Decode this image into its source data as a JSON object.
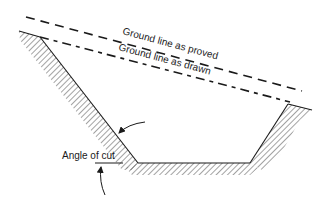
{
  "diagram": {
    "type": "cross-section",
    "labels": {
      "ground_proved": "Ground line as proved",
      "ground_drawn": "Ground line as drawn",
      "angle_of_cut": "Angle of cut"
    },
    "colors": {
      "line": "#1a1a1a",
      "hatch": "#333333",
      "background": "#ffffff"
    }
  }
}
